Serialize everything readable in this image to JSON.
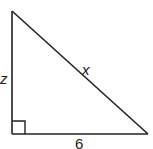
{
  "diagram": {
    "type": "right-triangle",
    "stroke_color": "#222222",
    "background": "#ffffff",
    "vertices": {
      "top": [
        12,
        11
      ],
      "right_angle": [
        12,
        134
      ],
      "right": [
        148,
        134
      ]
    },
    "right_angle_marker": {
      "corner": "bottom-left",
      "size": 13
    },
    "labels": {
      "vertical_side": "z",
      "hypotenuse": "x",
      "base": "6"
    }
  }
}
